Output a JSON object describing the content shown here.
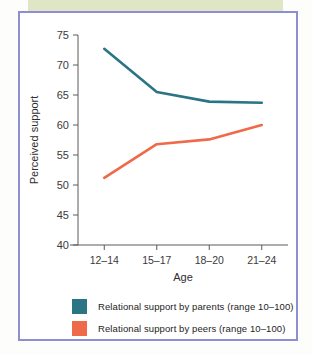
{
  "figure": {
    "background_color": "#ffffff",
    "frame_color": "#8e8ed2",
    "top_band_color": "#dfe6c6",
    "caption_fragment": ""
  },
  "chart_data": {
    "type": "line",
    "title": "",
    "xlabel": "Age",
    "ylabel": "Perceived support",
    "categories": [
      "12–14",
      "15–17",
      "18–20",
      "21–24"
    ],
    "ylim": [
      40,
      75
    ],
    "yticks": [
      40,
      45,
      50,
      55,
      60,
      65,
      70,
      75
    ],
    "ytick_labels": [
      "40",
      "45",
      "50",
      "55",
      "60",
      "65",
      "70",
      "75"
    ],
    "grid": false,
    "legend_position": "below",
    "series": [
      {
        "name": "Relational support by parents (range 10–100)",
        "color": "#2a7584",
        "values": [
          72.7,
          65.5,
          63.9,
          63.7
        ]
      },
      {
        "name": "Relational support by peers (range 10–100)",
        "color": "#ef6a4a",
        "values": [
          51.2,
          56.8,
          57.6,
          60.0
        ]
      }
    ]
  },
  "legend": {
    "items": [
      {
        "label": "Relational support by parents (range 10–100)",
        "color": "#2a7584"
      },
      {
        "label": "Relational support by peers (range 10–100)",
        "color": "#ef6a4a"
      }
    ]
  }
}
